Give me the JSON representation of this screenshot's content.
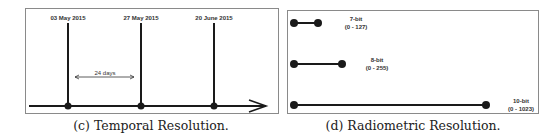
{
  "figure_c": {
    "caption": "(c) Temporal Resolution.",
    "dates": [
      "03 May 2015",
      "27 May 2015",
      "20 June 2015"
    ],
    "interval_label": "24 days"
  },
  "figure_d": {
    "caption": "(d) Radiometric Resolution.",
    "levels": [
      {
        "bits": "7-bit",
        "range": "(0 - 127)"
      },
      {
        "bits": "8-bit",
        "range": "(0 - 255)"
      },
      {
        "bits": "10-bit",
        "range": "(0 - 1023)"
      }
    ]
  },
  "colors": {
    "line": "#1a1a1a",
    "border": "#8a8a8a",
    "text": "#333333"
  }
}
